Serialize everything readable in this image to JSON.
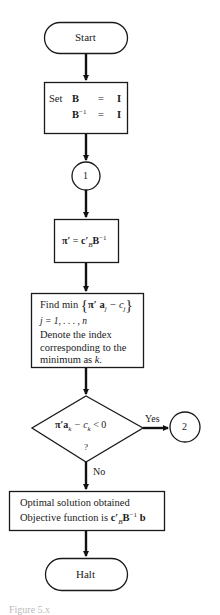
{
  "flowchart": {
    "start": {
      "label": "Start"
    },
    "init": {
      "keyword": "Set",
      "line1": {
        "lhs": "B",
        "eq": "=",
        "rhs": "I"
      },
      "line2": {
        "lhs": "B",
        "sup": "−1",
        "eq": "=",
        "rhs": "I"
      }
    },
    "connector1": {
      "label": "1"
    },
    "compute_pi": {
      "lhs": "π′",
      "eq": "=",
      "c": "c′",
      "sub": "B",
      "b": "B",
      "sup": "−1"
    },
    "find_min": {
      "line1_prefix": "Find min",
      "line1_expr": "π′ a",
      "line1_sub": "j",
      "line1_minus": " − c",
      "line1_sub2": "j",
      "line2": "j = 1, . . . , n",
      "line3": "Denote the index",
      "line4": "corresponding to the",
      "line5_prefix": "minimum as ",
      "line5_var": "k."
    },
    "decision": {
      "expr_pi": "π′a",
      "expr_sub": "k",
      "expr_mid": " − c",
      "expr_sub2": "k",
      "expr_end": " < 0",
      "question": "?",
      "yes_label": "Yes",
      "no_label": "No"
    },
    "connector2": {
      "label": "2"
    },
    "optimal": {
      "line1": "Optimal solution obtained",
      "line2_prefix": "Objective function is ",
      "c": "c′",
      "sub": "B",
      "b": "B",
      "sup": "−1",
      "vec": " b"
    },
    "halt": {
      "label": "Halt"
    }
  },
  "caption": "Figure 5.x"
}
